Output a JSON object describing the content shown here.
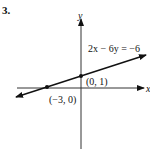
{
  "problem_number": "3.",
  "axes": {
    "x_label": "x",
    "y_label": "y"
  },
  "equation": "2x − 6y = −6",
  "points": [
    {
      "label": "(0, 1)",
      "x": 0,
      "y": 1
    },
    {
      "label": "(−3, 0)",
      "x": -3,
      "y": 0
    }
  ],
  "colors": {
    "ink": "#111111",
    "background": "#ffffff"
  }
}
